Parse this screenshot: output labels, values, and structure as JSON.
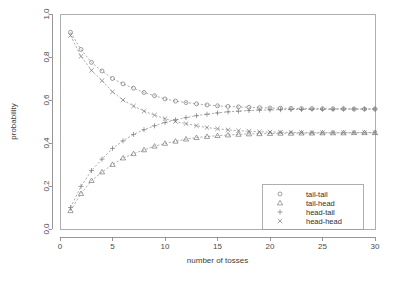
{
  "chart_data": {
    "type": "line",
    "title": "",
    "subtitle": "",
    "xlabel": "number of tosses",
    "ylabel": "probability",
    "xlim": [
      0,
      30
    ],
    "ylim": [
      0.0,
      1.0
    ],
    "xticks": [
      0,
      5,
      10,
      15,
      20,
      25,
      30
    ],
    "xticklabels": [
      "0",
      "5",
      "10",
      "15",
      "20",
      "25",
      "30"
    ],
    "yticks": [
      0.0,
      0.2,
      0.4,
      0.6,
      0.8,
      1.0
    ],
    "yticklabels": [
      "0.0",
      "0.2",
      "0.4",
      "0.6",
      "0.8",
      "1.0"
    ],
    "grid": false,
    "legend_position": "bottom-right",
    "x": [
      1,
      2,
      3,
      4,
      5,
      6,
      7,
      8,
      9,
      10,
      11,
      12,
      13,
      14,
      15,
      16,
      17,
      18,
      19,
      20,
      21,
      22,
      23,
      24,
      25,
      26,
      27,
      28,
      29,
      30
    ],
    "series": [
      {
        "name": "tail-tail",
        "marker": "circle",
        "values": [
          0.915,
          0.835,
          0.775,
          0.735,
          0.7,
          0.675,
          0.655,
          0.635,
          0.62,
          0.605,
          0.595,
          0.588,
          0.582,
          0.577,
          0.573,
          0.57,
          0.568,
          0.566,
          0.564,
          0.563,
          0.562,
          0.561,
          0.56,
          0.56,
          0.559,
          0.559,
          0.559,
          0.558,
          0.558,
          0.558
        ]
      },
      {
        "name": "tail-head",
        "marker": "triangle",
        "values": [
          0.085,
          0.165,
          0.225,
          0.265,
          0.3,
          0.33,
          0.35,
          0.368,
          0.385,
          0.398,
          0.408,
          0.418,
          0.425,
          0.43,
          0.434,
          0.437,
          0.44,
          0.442,
          0.443,
          0.444,
          0.445,
          0.445,
          0.446,
          0.446,
          0.447,
          0.447,
          0.447,
          0.448,
          0.448,
          0.448
        ]
      },
      {
        "name": "head-tail",
        "marker": "plus",
        "values": [
          0.1,
          0.198,
          0.272,
          0.325,
          0.375,
          0.41,
          0.44,
          0.462,
          0.48,
          0.495,
          0.508,
          0.518,
          0.527,
          0.534,
          0.54,
          0.545,
          0.548,
          0.551,
          0.553,
          0.554,
          0.555,
          0.556,
          0.556,
          0.557,
          0.557,
          0.557,
          0.558,
          0.558,
          0.558,
          0.558
        ]
      },
      {
        "name": "head-head",
        "marker": "cross",
        "values": [
          0.9,
          0.803,
          0.738,
          0.69,
          0.638,
          0.6,
          0.572,
          0.548,
          0.53,
          0.513,
          0.5,
          0.49,
          0.48,
          0.472,
          0.466,
          0.461,
          0.457,
          0.455,
          0.452,
          0.451,
          0.45,
          0.449,
          0.449,
          0.448,
          0.448,
          0.448,
          0.448,
          0.448,
          0.448,
          0.448
        ]
      }
    ],
    "legend": [
      {
        "label": "tail-tail",
        "marker": "circle"
      },
      {
        "label": "tail-head",
        "marker": "triangle"
      },
      {
        "label": "head-tail",
        "marker": "plus"
      },
      {
        "label": "head-head",
        "marker": "cross"
      }
    ]
  }
}
